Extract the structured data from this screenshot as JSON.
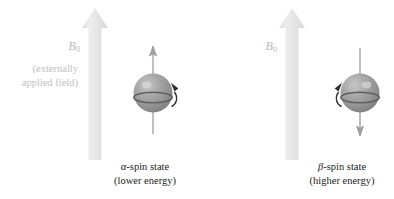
{
  "figure": {
    "background_color": "#ffffff",
    "field_arrow_color": "#e6e6e6",
    "field_label_color": "#b7b7b7",
    "sphere_color": "#9a9a9a",
    "caption_color": "#1c1c1c"
  },
  "panels": [
    {
      "id": "alpha",
      "field": {
        "label_symbol": "B",
        "label_subscript": "0",
        "note": "(externally\napplied field)",
        "note_line1": "(externally",
        "note_line2": "applied field)",
        "direction": "up"
      },
      "nucleus": {
        "spin_arrow_direction": "up",
        "rotation_arrow_side": "right",
        "rotation_direction": "clockwise"
      },
      "caption": {
        "greek_letter": "α",
        "state_text": "-spin state",
        "energy_text": "(lower energy)"
      }
    },
    {
      "id": "beta",
      "field": {
        "label_symbol": "B",
        "label_subscript": "0",
        "note": "",
        "note_line1": "",
        "note_line2": "",
        "direction": "up"
      },
      "nucleus": {
        "spin_arrow_direction": "down",
        "rotation_arrow_side": "left",
        "rotation_direction": "counterclockwise"
      },
      "caption": {
        "greek_letter": "β",
        "state_text": "-spin state",
        "energy_text": "(higher energy)"
      }
    }
  ]
}
